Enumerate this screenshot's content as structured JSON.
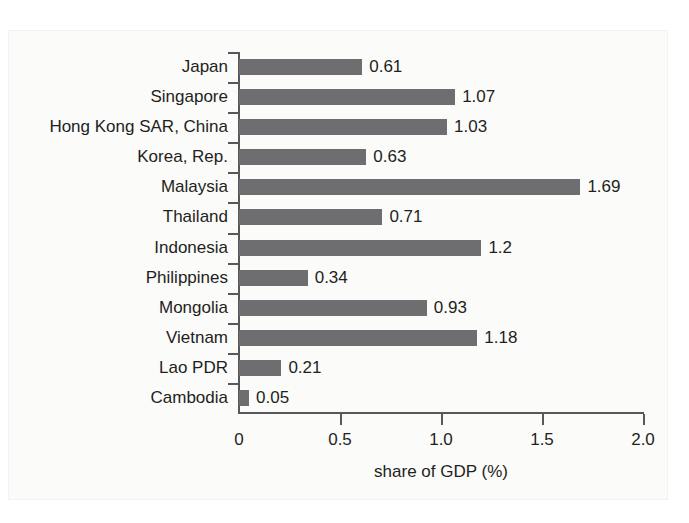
{
  "chart_data": {
    "type": "bar",
    "orientation": "horizontal",
    "title": "",
    "xlabel": "share of GDP (%)",
    "ylabel": "",
    "xlim": [
      0,
      2.0
    ],
    "xticks": [
      "0",
      "0.5",
      "1.0",
      "1.5",
      "2.0"
    ],
    "xtick_values": [
      0,
      0.5,
      1.0,
      1.5,
      2.0
    ],
    "grid": false,
    "legend": false,
    "bar_color": "#6e6e70",
    "axis_color": "#58585a",
    "text_color": "#231f20",
    "categories": [
      "Japan",
      "Singapore",
      "Hong Kong SAR, China",
      "Korea, Rep.",
      "Malaysia",
      "Thailand",
      "Indonesia",
      "Philippines",
      "Mongolia",
      "Vietnam",
      "Lao PDR",
      "Cambodia"
    ],
    "values": [
      0.61,
      1.07,
      1.03,
      0.63,
      1.69,
      0.71,
      1.2,
      0.34,
      0.93,
      1.18,
      0.21,
      0.05
    ],
    "value_labels": [
      "0.61",
      "1.07",
      "1.03",
      "0.63",
      "1.69",
      "0.71",
      "1.2",
      "0.34",
      "0.93",
      "1.18",
      "0.21",
      "0.05"
    ]
  }
}
